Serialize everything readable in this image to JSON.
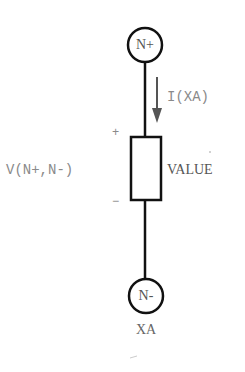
{
  "diagram": {
    "type": "circuit-element",
    "nodes": {
      "positive": "N+",
      "negative": "N-"
    },
    "current_label": "I(XA)",
    "voltage_label": "V(N+,N-)",
    "plus_sign": "+",
    "minus_sign": "−",
    "element_value": "VALUE",
    "element_name": "XA",
    "colors": {
      "wire": "#111111",
      "arrow": "#555555",
      "label": "#8a8a8a"
    }
  }
}
